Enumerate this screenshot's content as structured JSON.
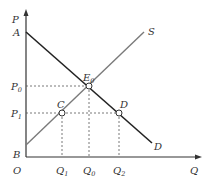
{
  "diagram": {
    "type": "supply-demand",
    "axes": {
      "y_label": "P",
      "x_label": "Q",
      "origin_label": "O"
    },
    "curves": {
      "demand": {
        "start_label": "A",
        "end_label": "D",
        "color": "#222222"
      },
      "supply": {
        "start_label": "B",
        "end_label": "S",
        "color": "#7a7a7a"
      }
    },
    "points": {
      "equilibrium": {
        "label": "E",
        "sub": "0"
      },
      "c": {
        "label": "C"
      },
      "d": {
        "label": "D"
      }
    },
    "price_levels": [
      {
        "label": "P",
        "sub": "0"
      },
      {
        "label": "P",
        "sub": "1"
      }
    ],
    "quantity_levels": [
      {
        "label": "Q",
        "sub": "1"
      },
      {
        "label": "Q",
        "sub": "0"
      },
      {
        "label": "Q",
        "sub": "2"
      }
    ]
  }
}
